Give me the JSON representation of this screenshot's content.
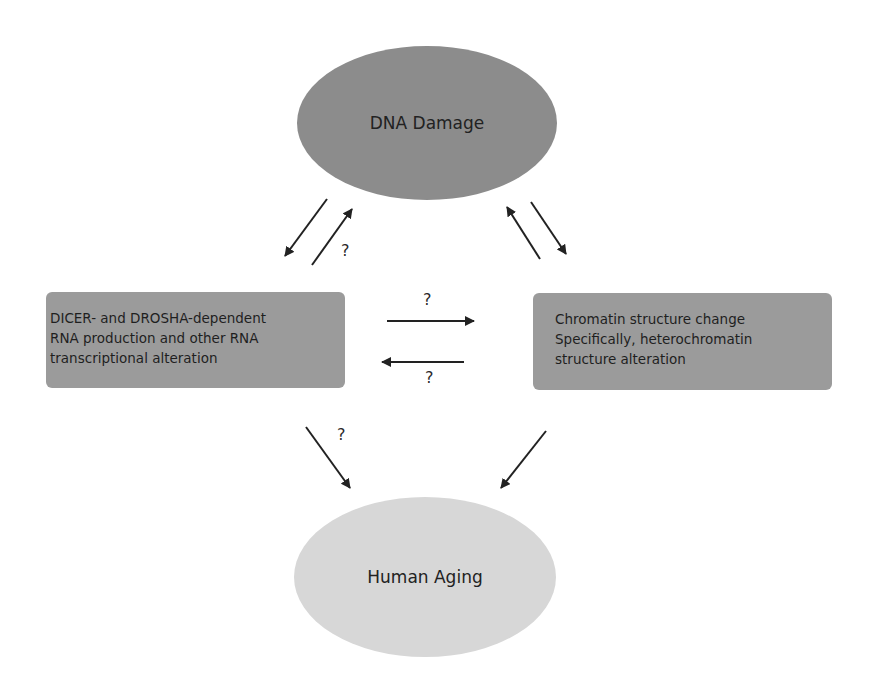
{
  "diagram": {
    "nodes": {
      "dna_damage": {
        "label": "DNA Damage",
        "shape": "ellipse",
        "color": "#8c8c8c"
      },
      "rna_box": {
        "lines": [
          "DICER- and DROSHA-dependent",
          "RNA production and other RNA",
          "transcriptional alteration"
        ],
        "shape": "rounded-rect",
        "color": "#9b9b9b"
      },
      "chromatin_box": {
        "lines": [
          "Chromatin structure change",
          "Specifically, heterochromatin",
          "structure alteration"
        ],
        "shape": "rounded-rect",
        "color": "#9b9b9b"
      },
      "human_aging": {
        "label": "Human Aging",
        "shape": "ellipse",
        "color": "#d7d7d7"
      }
    },
    "edges": [
      {
        "from": "dna_damage",
        "to": "rna_box",
        "label": ""
      },
      {
        "from": "rna_box",
        "to": "dna_damage",
        "label": "?"
      },
      {
        "from": "chromatin_box",
        "to": "dna_damage",
        "label": ""
      },
      {
        "from": "dna_damage",
        "to": "chromatin_box",
        "label": ""
      },
      {
        "from": "rna_box",
        "to": "chromatin_box",
        "label": "?"
      },
      {
        "from": "chromatin_box",
        "to": "rna_box",
        "label": "?"
      },
      {
        "from": "rna_box",
        "to": "human_aging",
        "label": "?"
      },
      {
        "from": "chromatin_box",
        "to": "human_aging",
        "label": ""
      }
    ],
    "question_marks": {
      "rna_to_dna": "?",
      "rna_to_chromatin": "?",
      "chromatin_to_rna": "?",
      "rna_to_aging": "?"
    }
  }
}
